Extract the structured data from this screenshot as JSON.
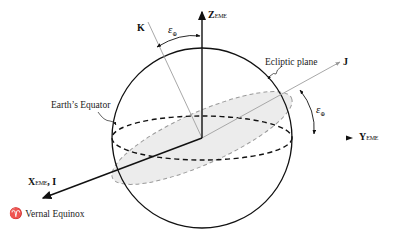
{
  "diagram": {
    "type": "celestial-reference-frame",
    "axes": {
      "z": {
        "label": "Z",
        "subscript": "EME"
      },
      "y": {
        "label": "Y",
        "subscript": "EME"
      },
      "x": {
        "label": "X",
        "subscript": "EME",
        "suffix": ", I"
      },
      "k": {
        "label": "K"
      },
      "j": {
        "label": "J"
      }
    },
    "angles": {
      "obliquity_top": {
        "symbol": "ε",
        "subscript": "⊕"
      },
      "obliquity_right": {
        "symbol": "ε",
        "subscript": "⊕"
      }
    },
    "annotations": {
      "ecliptic": "Ecliptic plane",
      "equator": "Earth’s Equator",
      "vernal_symbol": "♈",
      "vernal_text": "Vernal Equinox"
    },
    "colors": {
      "line": "#111111",
      "gray_line": "#a8a8a8",
      "plane_fill": "#ebebeb",
      "dash_gray": "#9a9a9a"
    }
  }
}
